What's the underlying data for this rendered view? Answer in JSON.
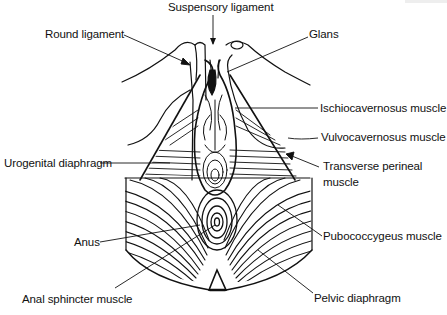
{
  "figure": {
    "type": "anatomical line drawing",
    "colors": {
      "background": "#ffffff",
      "ink": "#111111"
    }
  },
  "labels": [
    {
      "id": "suspensory",
      "text": "Suspensory ligament",
      "x": 168,
      "y": 1
    },
    {
      "id": "round",
      "text": "Round ligament",
      "x": 45,
      "y": 28
    },
    {
      "id": "glans",
      "text": "Glans",
      "x": 309,
      "y": 28
    },
    {
      "id": "ischio",
      "text": "Ischiocavernosus muscle",
      "x": 320,
      "y": 102
    },
    {
      "id": "vulvo",
      "text": "Vulvocavernosus muscle",
      "x": 321,
      "y": 131
    },
    {
      "id": "urogenital",
      "text": "Urogenital diaphragm",
      "x": 4,
      "y": 157
    },
    {
      "id": "transverse_1",
      "text": "Transverse perineal",
      "x": 323,
      "y": 160
    },
    {
      "id": "transverse_2",
      "text": "muscle",
      "x": 323,
      "y": 176
    },
    {
      "id": "pubococcygeus",
      "text": "Pubococcygeus muscle",
      "x": 323,
      "y": 230
    },
    {
      "id": "anus",
      "text": "Anus",
      "x": 74,
      "y": 236
    },
    {
      "id": "anal_sphincter",
      "text": "Anal sphincter muscle",
      "x": 22,
      "y": 293
    },
    {
      "id": "pelvic",
      "text": "Pelvic diaphragm",
      "x": 314,
      "y": 292
    }
  ]
}
